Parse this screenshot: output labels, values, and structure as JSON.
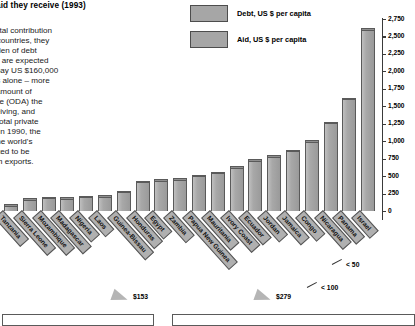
{
  "chart_data": {
    "type": "bar",
    "title": "...the aid they receive (1993)",
    "xlabel": "",
    "ylabel": "US $ per capita",
    "ylim": [
      0,
      2750
    ],
    "grid": false,
    "legend_position": "top-center",
    "tick_labels": [
      "0",
      "250",
      "500",
      "750",
      "1,000",
      "1,250",
      "1,500",
      "1,750",
      "2,000",
      "2,250",
      "2,500",
      "2,750"
    ],
    "tick_values": [
      0,
      250,
      500,
      750,
      1000,
      1250,
      1500,
      1750,
      2000,
      2250,
      2500,
      2750
    ],
    "categories": [
      "Tanzania",
      "Sierra Leone",
      "Mozambique",
      "Madagascar",
      "Nigeria",
      "Laos",
      "Guinea-Bissau",
      "Honduras",
      "Egypt",
      "Zambia",
      "Papua New Guinea",
      "Mauritania",
      "Ivory Coast",
      "Ecuador",
      "Jordan",
      "Jamaica",
      "Congo",
      "Nicaragua",
      "Panama",
      "Israel"
    ],
    "series": [
      {
        "name": "Debt, US $ per capita",
        "values": [
          95,
          185,
          205,
          195,
          215,
          225,
          290,
          430,
          455,
          470,
          520,
          560,
          640,
          740,
          800,
          880,
          1010,
          1280,
          1620,
          2620
        ]
      }
    ],
    "annotations": [
      {
        "text": "$153",
        "note": "aid-per-capita callout, left group"
      },
      {
        "text": "$279",
        "note": "aid-per-capita callout, right group"
      },
      {
        "text": "< 50",
        "note": "aid bar too small to plot"
      },
      {
        "text": "< 100",
        "note": "aid bar too small to plot"
      }
    ]
  },
  "legend": {
    "items": [
      {
        "label": "Debt, US $ per capita",
        "color": "#a6a6a6"
      },
      {
        "label": "Aid, US $ per capita",
        "color": "#a6a6a6"
      }
    ]
  },
  "body_copy": "...make a vital contribution\n...s poorer countries, they\n...y the burden of debt\n...conomies are expected\n...y had to pay US $160,000\n...e charges alone – more\n...mes the amount of\n...Assistance (ODA) the\n...were receiving, and\n...ore than total private\n...me year. In 1990, the\n..., one of the world's\n...re estimated to be\n...nings from exports."
}
